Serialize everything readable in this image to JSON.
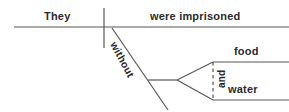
{
  "diagram": {
    "kind": "sentence-diagram",
    "sentence": "They were imprisoned without food and water.",
    "stroke_color": "#575757",
    "text_color": "#2b2b2b",
    "background_color": "#ffffff",
    "labels": {
      "subject": "They",
      "predicate": "were imprisoned",
      "preposition": "without",
      "object_1": "food",
      "conjunction": "and",
      "object_2": "water"
    },
    "lines": {
      "baseline": {
        "x1": 14,
        "y1": 27,
        "x2": 289,
        "y2": 27,
        "style": "solid"
      },
      "subject_predicate_divider": {
        "x1": 104,
        "y1": 8,
        "x2": 104,
        "y2": 48,
        "style": "solid"
      },
      "preposition_slant": {
        "x1": 112,
        "y1": 28,
        "x2": 168,
        "y2": 110,
        "style": "solid"
      },
      "object_stem": {
        "x1": 148,
        "y1": 80,
        "x2": 177,
        "y2": 80,
        "style": "solid"
      },
      "fork_upper": {
        "x1": 177,
        "y1": 80,
        "x2": 213,
        "y2": 62,
        "style": "solid"
      },
      "fork_lower": {
        "x1": 177,
        "y1": 80,
        "x2": 213,
        "y2": 100,
        "style": "solid"
      },
      "object_1_line": {
        "x1": 213,
        "y1": 62,
        "x2": 289,
        "y2": 62,
        "style": "solid"
      },
      "object_2_line": {
        "x1": 213,
        "y1": 100,
        "x2": 289,
        "y2": 100,
        "style": "solid"
      },
      "conjunction_dashed": {
        "x1": 213,
        "y1": 62,
        "x2": 213,
        "y2": 100,
        "style": "dashed"
      }
    }
  }
}
